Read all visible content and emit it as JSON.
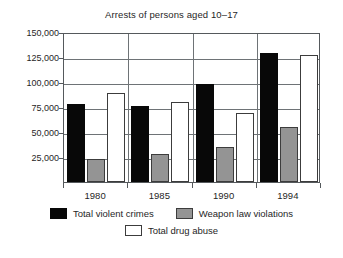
{
  "chart_data": {
    "type": "bar",
    "title": "Arrests of persons aged 10–17",
    "xlabel": "",
    "ylabel": "",
    "categories": [
      "1980",
      "1985",
      "1990",
      "1994"
    ],
    "series": [
      {
        "name": "Total violent crimes",
        "color": "#080808",
        "values": [
          78000,
          76000,
          98000,
          129000
        ]
      },
      {
        "name": "Weapon law violations",
        "color": "#949494",
        "values": [
          23000,
          28000,
          35000,
          55000
        ]
      },
      {
        "name": "Total drug abuse",
        "color": "#ffffff",
        "values": [
          89000,
          80000,
          69000,
          127000
        ]
      }
    ],
    "ylim": [
      0,
      150000
    ],
    "yticks": [
      150000,
      125000,
      100000,
      75000,
      50000,
      25000
    ],
    "ytick_labels": [
      "150,000",
      "125,000",
      "100,000",
      "75,000",
      "50,000",
      "25,000"
    ],
    "grid": true,
    "legend_position": "bottom"
  },
  "legend": {
    "entries": [
      {
        "label": "Total violent crimes"
      },
      {
        "label": "Weapon law violations"
      },
      {
        "label": "Total drug abuse"
      }
    ]
  }
}
